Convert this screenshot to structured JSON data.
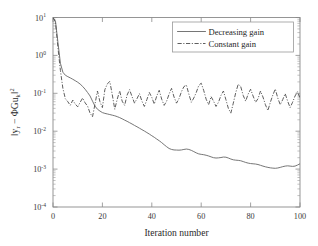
{
  "chart_data": {
    "type": "line",
    "title": "",
    "xlabel": "Iteration number",
    "ylabel": "||y_r − ΦGu_k||²",
    "ylabel_parts": {
      "norm_open": "‖",
      "y_base": "y",
      "y_sub": "r",
      "minus": " − ",
      "phi": "Φ",
      "g": "G",
      "u_base": "u",
      "u_sub": "k",
      "norm_close": "‖",
      "sup": "2"
    },
    "xlim": [
      0,
      100
    ],
    "ylim": [
      0.0001,
      10
    ],
    "yscale": "log",
    "xscale": "linear",
    "grid": false,
    "xticks": [
      0,
      20,
      40,
      60,
      80,
      100
    ],
    "xticklabels": [
      "0",
      "20",
      "40",
      "60",
      "80",
      "100"
    ],
    "yticks": [
      10,
      1,
      0.1,
      0.01,
      0.001,
      0.0001
    ],
    "yticklabels": [
      {
        "base": "10",
        "exp": "1"
      },
      {
        "base": "10",
        "exp": "0"
      },
      {
        "base": "10",
        "exp": "-1"
      },
      {
        "base": "10",
        "exp": "-2"
      },
      {
        "base": "10",
        "exp": "-3"
      },
      {
        "base": "10",
        "exp": "-4"
      }
    ],
    "legend": {
      "position": "upper-right",
      "entries": [
        {
          "label": "Decreasing gain",
          "style": "solid",
          "color": "#6f6f6f"
        },
        {
          "label": "Constant gain",
          "style": "dashdot",
          "color": "#555555"
        }
      ]
    },
    "series": [
      {
        "name": "Decreasing gain",
        "style": "solid",
        "x": [
          0,
          1,
          2,
          3,
          4,
          5,
          6,
          7,
          8,
          9,
          10,
          11,
          12,
          13,
          14,
          15,
          16,
          17,
          18,
          19,
          20,
          21,
          22,
          23,
          24,
          25,
          26,
          27,
          28,
          29,
          30,
          31,
          32,
          33,
          34,
          35,
          36,
          37,
          38,
          39,
          40,
          41,
          42,
          43,
          44,
          45,
          46,
          47,
          48,
          49,
          50,
          51,
          52,
          53,
          54,
          55,
          56,
          57,
          58,
          59,
          60,
          61,
          62,
          63,
          64,
          65,
          66,
          67,
          68,
          69,
          70,
          71,
          72,
          73,
          74,
          75,
          76,
          77,
          78,
          79,
          80,
          81,
          82,
          83,
          84,
          85,
          86,
          87,
          88,
          89,
          90,
          91,
          92,
          93,
          94,
          95,
          96,
          97,
          98,
          99,
          100
        ],
        "y": [
          10.0,
          8.0,
          2.2,
          0.62,
          0.36,
          0.3,
          0.275,
          0.255,
          0.235,
          0.215,
          0.196,
          0.175,
          0.152,
          0.128,
          0.105,
          0.085,
          0.062,
          0.046,
          0.038,
          0.034,
          0.031,
          0.0295,
          0.0285,
          0.0275,
          0.0265,
          0.0255,
          0.0242,
          0.0228,
          0.0212,
          0.0196,
          0.0182,
          0.0168,
          0.0155,
          0.0142,
          0.0131,
          0.012,
          0.011,
          0.0101,
          0.0092,
          0.0084,
          0.0076,
          0.0069,
          0.0062,
          0.0056,
          0.005,
          0.0044,
          0.0039,
          0.0035,
          0.0033,
          0.0032,
          0.00318,
          0.00316,
          0.0032,
          0.0033,
          0.00338,
          0.0033,
          0.00312,
          0.0029,
          0.00268,
          0.00252,
          0.00245,
          0.0024,
          0.00232,
          0.00222,
          0.0021,
          0.002,
          0.00196,
          0.00198,
          0.00202,
          0.00208,
          0.00206,
          0.00196,
          0.00184,
          0.00176,
          0.00172,
          0.0017,
          0.00166,
          0.00158,
          0.0015,
          0.00144,
          0.0014,
          0.00138,
          0.00136,
          0.00132,
          0.00126,
          0.0012,
          0.00115,
          0.00111,
          0.00108,
          0.00106,
          0.00105,
          0.00107,
          0.00111,
          0.00116,
          0.0012,
          0.00122,
          0.0012,
          0.00118,
          0.0012,
          0.00128,
          0.00138
        ]
      },
      {
        "name": "Constant gain",
        "style": "dashdot",
        "x": [
          0,
          1,
          2,
          3,
          4,
          5,
          6,
          7,
          8,
          9,
          10,
          11,
          12,
          13,
          14,
          15,
          16,
          17,
          18,
          19,
          20,
          21,
          22,
          23,
          24,
          25,
          26,
          27,
          28,
          29,
          30,
          31,
          32,
          33,
          34,
          35,
          36,
          37,
          38,
          39,
          40,
          41,
          42,
          43,
          44,
          45,
          46,
          47,
          48,
          49,
          50,
          51,
          52,
          53,
          54,
          55,
          56,
          57,
          58,
          59,
          60,
          61,
          62,
          63,
          64,
          65,
          66,
          67,
          68,
          69,
          70,
          71,
          72,
          73,
          74,
          75,
          76,
          77,
          78,
          79,
          80,
          81,
          82,
          83,
          84,
          85,
          86,
          87,
          88,
          89,
          90,
          91,
          92,
          93,
          94,
          95,
          96,
          97,
          98,
          99,
          100
        ],
        "y": [
          10.0,
          7.5,
          1.6,
          0.4,
          0.135,
          0.072,
          0.06,
          0.048,
          0.066,
          0.052,
          0.044,
          0.058,
          0.075,
          0.056,
          0.046,
          0.03,
          0.024,
          0.052,
          0.115,
          0.06,
          0.042,
          0.125,
          0.178,
          0.205,
          0.092,
          0.038,
          0.07,
          0.115,
          0.062,
          0.048,
          0.09,
          0.125,
          0.082,
          0.055,
          0.072,
          0.098,
          0.062,
          0.045,
          0.068,
          0.105,
          0.078,
          0.052,
          0.085,
          0.12,
          0.07,
          0.048,
          0.062,
          0.095,
          0.135,
          0.08,
          0.055,
          0.072,
          0.11,
          0.15,
          0.165,
          0.095,
          0.058,
          0.075,
          0.105,
          0.16,
          0.185,
          0.12,
          0.07,
          0.05,
          0.082,
          0.062,
          0.045,
          0.058,
          0.088,
          0.115,
          0.068,
          0.04,
          0.03,
          0.055,
          0.105,
          0.175,
          0.15,
          0.088,
          0.062,
          0.095,
          0.128,
          0.085,
          0.058,
          0.072,
          0.115,
          0.08,
          0.05,
          0.035,
          0.058,
          0.09,
          0.13,
          0.075,
          0.05,
          0.068,
          0.098,
          0.062,
          0.042,
          0.058,
          0.085,
          0.11,
          0.075
        ]
      }
    ]
  }
}
